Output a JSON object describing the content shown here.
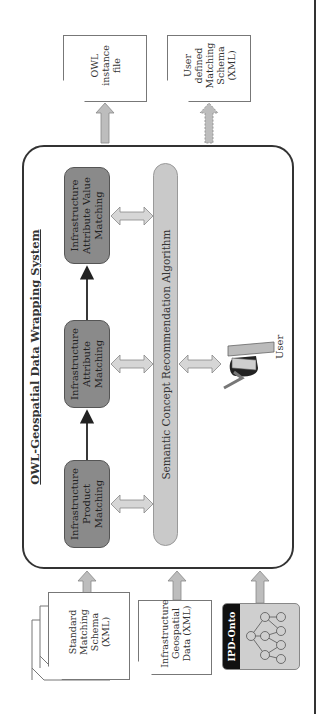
{
  "title": "OWL-Geospatial Data Wrapping System",
  "process_boxes": [
    {
      "id": "product",
      "label": "Infrastructure Product Matching"
    },
    {
      "id": "attribute",
      "label": "Infrastructure Attribute Matching"
    },
    {
      "id": "value",
      "label": "Infrastructure Attribute Value Matching"
    }
  ],
  "algorithm_label": "Semantic Concept Recommendation Algorithm",
  "user_label": "User",
  "inputs": [
    {
      "id": "standard-schema",
      "label": "Standard Matching Schema (XML)",
      "stacked": true
    },
    {
      "id": "geospatial-data",
      "label": "Infrastructure Geospatial Data (XML)"
    },
    {
      "id": "ipd-onto",
      "label": "IPD-Onto"
    }
  ],
  "outputs": [
    {
      "id": "owl-instance",
      "label": "OWL instance file",
      "arrow": "solid"
    },
    {
      "id": "user-schema",
      "label": "User defined Matching Schema (XML)",
      "arrow": "dashed"
    }
  ],
  "colors": {
    "process_fill": "#8a8a8a",
    "algorithm_fill": "#c9c9c9",
    "arrow_fill": "#bdbdbd",
    "ontology_fill": "#cfcfcf",
    "ontology_label_bg": "#111111",
    "border": "#333333"
  }
}
